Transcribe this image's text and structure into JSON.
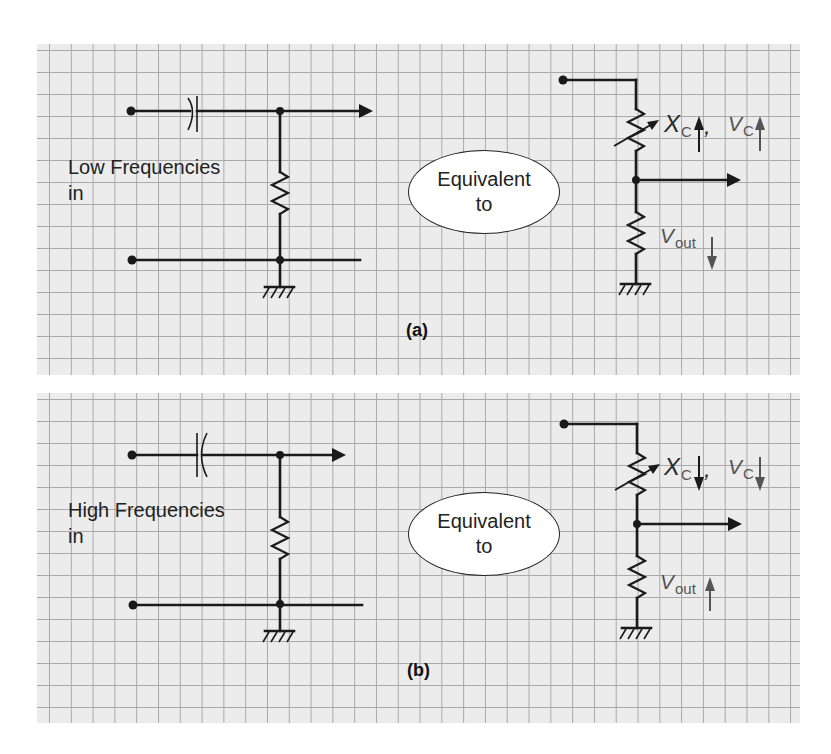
{
  "figure": {
    "panels": [
      {
        "id": "a",
        "caption": "(a)",
        "input_label_line1": "Low Frequencies",
        "input_label_line2": "in",
        "equivalence_line1": "Equivalent",
        "equivalence_line2": "to",
        "xc_symbol": "X",
        "xc_subscript": "C",
        "comma": ",",
        "vc_symbol": "V",
        "vc_subscript": "C",
        "vout_symbol": "V",
        "vout_subscript": "out",
        "xc_direction": "up",
        "vc_direction": "up",
        "vout_direction": "down"
      },
      {
        "id": "b",
        "caption": "(b)",
        "input_label_line1": "High Frequencies",
        "input_label_line2": "in",
        "equivalence_line1": "Equivalent",
        "equivalence_line2": "to",
        "xc_symbol": "X",
        "xc_subscript": "C",
        "comma": ",",
        "vc_symbol": "V",
        "vc_subscript": "C",
        "vout_symbol": "V",
        "vout_subscript": "out",
        "xc_direction": "down",
        "vc_direction": "down",
        "vout_direction": "up"
      }
    ],
    "colors": {
      "grid_background": "#ececec",
      "grid_lines": "#a9a9a9",
      "wire": "#1a1a1a",
      "indicator_arrows": "#555555"
    }
  }
}
